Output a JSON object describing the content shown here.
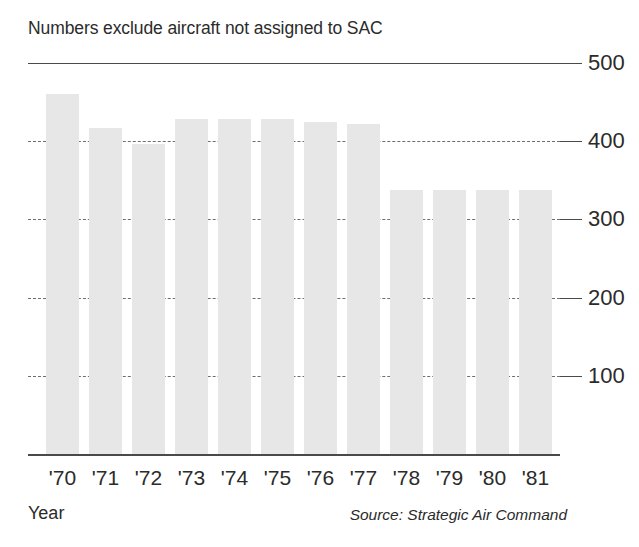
{
  "chart_data": {
    "type": "bar",
    "title": "Numbers exclude aircraft not assigned to SAC",
    "xlabel": "Year",
    "ylabel": "",
    "source": "Source: Strategic Air Command",
    "categories": [
      "'70",
      "'71",
      "'72",
      "'73",
      "'74",
      "'75",
      "'76",
      "'77",
      "'78",
      "'79",
      "'80",
      "'81"
    ],
    "values": [
      460,
      417,
      397,
      428,
      428,
      428,
      425,
      422,
      337,
      337,
      337,
      338
    ],
    "ylim": [
      0,
      500
    ],
    "ytick_labels": [
      "500",
      "400",
      "300",
      "200",
      "100"
    ],
    "ytick_values": [
      500,
      400,
      300,
      200,
      100
    ],
    "grid": true,
    "legend": "none",
    "bar_color": "#e7e7e7",
    "axis_color": "#4a4a4a",
    "text_color": "#2b2b2b"
  }
}
